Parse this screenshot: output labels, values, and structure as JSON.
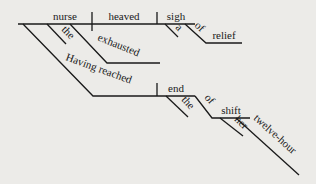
{
  "diagram": {
    "type": "reed-kellogg-sentence-diagram",
    "sentence_parts": {
      "subject": "nurse",
      "verb": "heaved",
      "object": "sigh",
      "subject_modifiers": [
        "the",
        "exhausted"
      ],
      "participial_phrase": "Having reached",
      "participle_object": "end",
      "participle_object_modifiers": [
        "the"
      ],
      "prep1": "of",
      "prep1_object": "shift",
      "prep1_object_modifiers": [
        "her",
        "twelve-hour"
      ],
      "object_modifiers": [
        "a"
      ],
      "prep2": "of",
      "prep2_object": "relief"
    }
  }
}
